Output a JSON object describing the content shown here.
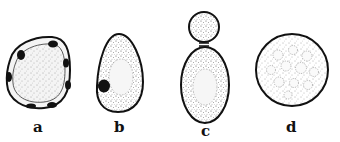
{
  "figure": {
    "panels": [
      {
        "id": "a",
        "label": "a",
        "shape": "rounded-irregular cell with peripheral dark granules"
      },
      {
        "id": "b",
        "label": "b",
        "shape": "egg-shaped cell with central vacuole and dark nucleus-like body"
      },
      {
        "id": "c",
        "label": "c",
        "shape": "budding cell: small round bud atop oval mother cell"
      },
      {
        "id": "d",
        "label": "d",
        "shape": "round cell with many small vacuoles"
      }
    ],
    "colors": {
      "outline": "#111111",
      "stipple": "#555555",
      "background": "#ffffff"
    }
  }
}
